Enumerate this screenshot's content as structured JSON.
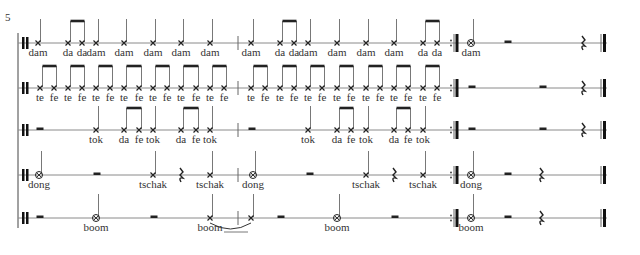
{
  "score": {
    "measure_number": "5",
    "colors": {
      "ink": "#222222",
      "staff": "#8a8a8a",
      "lyric": "#333333"
    },
    "system": {
      "x": 18,
      "top": 33,
      "bottom": 228
    },
    "staves": [
      {
        "name": "dam-staff",
        "y": 43,
        "start_rest": null,
        "notes": [
          {
            "x": 38,
            "head": "x",
            "lyric": "dam"
          },
          {
            "x": 68,
            "head": "x",
            "lyric": "da",
            "beam": "start"
          },
          {
            "x": 82,
            "head": "x",
            "lyric": "da",
            "beam": "end"
          },
          {
            "x": 96,
            "head": "x",
            "lyric": "dam"
          },
          {
            "x": 124,
            "head": "x",
            "lyric": "dam"
          },
          {
            "x": 153,
            "head": "x",
            "lyric": "dam"
          },
          {
            "x": 181,
            "head": "x",
            "lyric": "dam"
          },
          {
            "x": 210,
            "head": "x",
            "lyric": "dam"
          },
          {
            "x": 251,
            "head": "x",
            "lyric": "dam"
          },
          {
            "x": 280,
            "head": "x",
            "lyric": "da",
            "beam": "start"
          },
          {
            "x": 294,
            "head": "x",
            "lyric": "da",
            "beam": "end"
          },
          {
            "x": 308,
            "head": "x",
            "lyric": "dam"
          },
          {
            "x": 337,
            "head": "x",
            "lyric": "dam"
          },
          {
            "x": 366,
            "head": "x",
            "lyric": "dam"
          },
          {
            "x": 394,
            "head": "x",
            "lyric": "dam"
          },
          {
            "x": 423,
            "head": "x",
            "lyric": "da",
            "beam": "start"
          },
          {
            "x": 437,
            "head": "x",
            "lyric": "da",
            "beam": "end"
          },
          {
            "x": 471,
            "head": "o",
            "lyric": "dam"
          }
        ],
        "rests": [
          {
            "x": 508,
            "type": "half"
          },
          {
            "x": 583,
            "type": "quarter"
          }
        ]
      },
      {
        "name": "te-fe-staff",
        "y": 88,
        "notes": [
          {
            "x": 40,
            "head": "x",
            "lyric": "te",
            "beam": "start"
          },
          {
            "x": 54,
            "head": "x",
            "lyric": "fe",
            "beam": "end"
          },
          {
            "x": 68,
            "head": "x",
            "lyric": "te",
            "beam": "start"
          },
          {
            "x": 82,
            "head": "x",
            "lyric": "fe",
            "beam": "end"
          },
          {
            "x": 96,
            "head": "x",
            "lyric": "te",
            "beam": "start"
          },
          {
            "x": 110,
            "head": "x",
            "lyric": "fe",
            "beam": "end"
          },
          {
            "x": 124,
            "head": "x",
            "lyric": "te",
            "beam": "start"
          },
          {
            "x": 139,
            "head": "x",
            "lyric": "fe",
            "beam": "end"
          },
          {
            "x": 153,
            "head": "x",
            "lyric": "te",
            "beam": "start"
          },
          {
            "x": 167,
            "head": "x",
            "lyric": "fe",
            "beam": "end"
          },
          {
            "x": 181,
            "head": "x",
            "lyric": "te",
            "beam": "start"
          },
          {
            "x": 196,
            "head": "x",
            "lyric": "fe",
            "beam": "end"
          },
          {
            "x": 210,
            "head": "x",
            "lyric": "te",
            "beam": "start"
          },
          {
            "x": 224,
            "head": "x",
            "lyric": "fe",
            "beam": "end"
          },
          {
            "x": 251,
            "head": "x",
            "lyric": "te",
            "beam": "start"
          },
          {
            "x": 265,
            "head": "x",
            "lyric": "fe",
            "beam": "end"
          },
          {
            "x": 280,
            "head": "x",
            "lyric": "te",
            "beam": "start"
          },
          {
            "x": 294,
            "head": "x",
            "lyric": "fe",
            "beam": "end"
          },
          {
            "x": 308,
            "head": "x",
            "lyric": "te",
            "beam": "start"
          },
          {
            "x": 322,
            "head": "x",
            "lyric": "fe",
            "beam": "end"
          },
          {
            "x": 337,
            "head": "x",
            "lyric": "te",
            "beam": "start"
          },
          {
            "x": 351,
            "head": "x",
            "lyric": "fe",
            "beam": "end"
          },
          {
            "x": 366,
            "head": "x",
            "lyric": "te",
            "beam": "start"
          },
          {
            "x": 380,
            "head": "x",
            "lyric": "fe",
            "beam": "end"
          },
          {
            "x": 394,
            "head": "x",
            "lyric": "te",
            "beam": "start"
          },
          {
            "x": 408,
            "head": "x",
            "lyric": "fe",
            "beam": "end"
          },
          {
            "x": 423,
            "head": "x",
            "lyric": "te",
            "beam": "start"
          },
          {
            "x": 437,
            "head": "x",
            "lyric": "fe",
            "beam": "end"
          }
        ],
        "rests": [
          {
            "x": 472,
            "type": "half"
          },
          {
            "x": 543,
            "type": "half"
          },
          {
            "x": 583,
            "type": "quarter"
          }
        ]
      },
      {
        "name": "tok-staff",
        "y": 130,
        "notes": [
          {
            "x": 96,
            "head": "x",
            "lyric": "tok"
          },
          {
            "x": 124,
            "head": "x",
            "lyric": "da",
            "beam": "start"
          },
          {
            "x": 139,
            "head": "x",
            "lyric": "fe",
            "beam": "end"
          },
          {
            "x": 153,
            "head": "x",
            "lyric": "tok"
          },
          {
            "x": 181,
            "head": "x",
            "lyric": "da",
            "beam": "start"
          },
          {
            "x": 196,
            "head": "x",
            "lyric": "fe",
            "beam": "end"
          },
          {
            "x": 210,
            "head": "x",
            "lyric": "tok"
          },
          {
            "x": 308,
            "head": "x",
            "lyric": "tok"
          },
          {
            "x": 337,
            "head": "x",
            "lyric": "da",
            "beam": "start"
          },
          {
            "x": 351,
            "head": "x",
            "lyric": "fe",
            "beam": "end"
          },
          {
            "x": 366,
            "head": "x",
            "lyric": "tok"
          },
          {
            "x": 394,
            "head": "x",
            "lyric": "da",
            "beam": "start"
          },
          {
            "x": 408,
            "head": "x",
            "lyric": "fe",
            "beam": "end"
          },
          {
            "x": 423,
            "head": "x",
            "lyric": "tok"
          }
        ],
        "rests": [
          {
            "x": 40,
            "type": "half"
          },
          {
            "x": 252,
            "type": "half"
          },
          {
            "x": 472,
            "type": "half"
          },
          {
            "x": 543,
            "type": "half"
          },
          {
            "x": 583,
            "type": "quarter"
          }
        ]
      },
      {
        "name": "dong-tschak-staff",
        "y": 175,
        "notes": [
          {
            "x": 39,
            "head": "o",
            "lyric": "dong"
          },
          {
            "x": 153,
            "head": "x",
            "lyric": "tschak"
          },
          {
            "x": 210,
            "head": "x",
            "lyric": "tschak"
          },
          {
            "x": 253,
            "head": "o",
            "lyric": "dong"
          },
          {
            "x": 366,
            "head": "x",
            "lyric": "tschak"
          },
          {
            "x": 423,
            "head": "x",
            "lyric": "tschak"
          },
          {
            "x": 471,
            "head": "o",
            "lyric": "dong"
          }
        ],
        "rests": [
          {
            "x": 97,
            "type": "half"
          },
          {
            "x": 181,
            "type": "quarter"
          },
          {
            "x": 310,
            "type": "half"
          },
          {
            "x": 394,
            "type": "quarter"
          },
          {
            "x": 508,
            "type": "half"
          },
          {
            "x": 541,
            "type": "quarter"
          }
        ]
      },
      {
        "name": "boom-staff",
        "y": 218,
        "notes": [
          {
            "x": 96,
            "head": "o",
            "lyric": "boom"
          },
          {
            "x": 210,
            "head": "x",
            "lyric": "boom",
            "tie_to": 251,
            "extender": true
          },
          {
            "x": 251,
            "head": "x",
            "lyric": ""
          },
          {
            "x": 337,
            "head": "o",
            "lyric": "boom"
          },
          {
            "x": 471,
            "head": "o",
            "lyric": "boom"
          }
        ],
        "rests": [
          {
            "x": 40,
            "type": "half"
          },
          {
            "x": 154,
            "type": "half"
          },
          {
            "x": 281,
            "type": "half"
          },
          {
            "x": 395,
            "type": "half"
          },
          {
            "x": 508,
            "type": "half"
          },
          {
            "x": 541,
            "type": "quarter"
          }
        ]
      }
    ],
    "barlines": {
      "start_x": 24,
      "mid_x": 238,
      "repeat_end_x": 455,
      "final_x": 603
    }
  }
}
